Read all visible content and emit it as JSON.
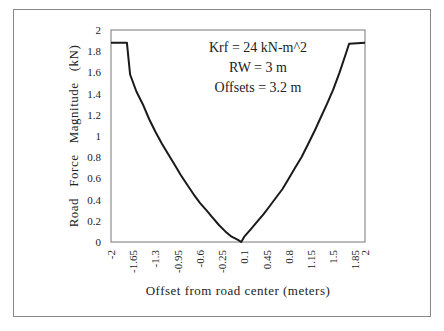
{
  "chart_data": {
    "type": "line",
    "title": "",
    "xlabel": "Offset from road center (meters)",
    "ylabel": "Road   Force   Magnitude   (kN)",
    "xlim": [
      -2,
      2
    ],
    "ylim": [
      0,
      2
    ],
    "x_ticks": [
      "-2",
      "-1.65",
      "-1.3",
      "-0.95",
      "-0.6",
      "-0.25",
      "0.1",
      "0.45",
      "0.8",
      "1.15",
      "1.5",
      "1.85",
      "2"
    ],
    "y_ticks": [
      "0",
      "0.2",
      "0.4",
      "0.6",
      "0.8",
      "1",
      "1.2",
      "1.4",
      "1.6",
      "1.8",
      "2"
    ],
    "grid": false,
    "legend": null,
    "annotations": [
      "Krf  =  24  kN-m^2",
      "RW  =  3  m",
      "Offsets   =  3.2  m"
    ],
    "series": [
      {
        "name": "Road Force Magnitude",
        "x": [
          -2,
          -1.75,
          -1.7,
          -1.6,
          -1.5,
          -1.4,
          -1.3,
          -1.2,
          -1.1,
          -1.0,
          -0.9,
          -0.8,
          -0.7,
          -0.6,
          -0.5,
          -0.4,
          -0.3,
          -0.2,
          -0.1,
          0.0,
          0.05,
          0.1,
          0.2,
          0.3,
          0.4,
          0.5,
          0.6,
          0.7,
          0.8,
          0.9,
          1.0,
          1.1,
          1.2,
          1.3,
          1.4,
          1.5,
          1.6,
          1.7,
          1.75,
          2
        ],
        "values": [
          1.88,
          1.88,
          1.58,
          1.42,
          1.3,
          1.16,
          1.04,
          0.93,
          0.83,
          0.73,
          0.63,
          0.54,
          0.45,
          0.37,
          0.3,
          0.23,
          0.16,
          0.1,
          0.05,
          0.02,
          0.0,
          0.05,
          0.12,
          0.19,
          0.26,
          0.34,
          0.42,
          0.5,
          0.6,
          0.7,
          0.8,
          0.92,
          1.04,
          1.17,
          1.3,
          1.44,
          1.6,
          1.78,
          1.87,
          1.88
        ]
      }
    ]
  }
}
